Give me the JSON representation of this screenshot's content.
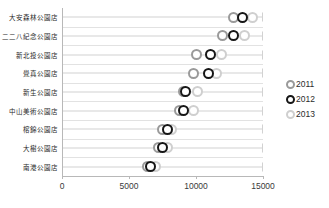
{
  "chart_data": {
    "type": "scatter",
    "title": "",
    "subtitle": "",
    "xlabel": "",
    "ylabel": "",
    "xlim": [
      0,
      15000
    ],
    "xticks": [
      "0",
      "5000",
      "10000",
      "15000"
    ],
    "xtick_values": [
      0,
      5000,
      10000,
      15000
    ],
    "grid": true,
    "legend_position": "right",
    "categories": [
      "大安森林公園店",
      "二二八紀念公園店",
      "新北投公園店",
      "覺真公園店",
      "新生公園店",
      "中山美術公園店",
      "榕錦公園店",
      "大樹公園店",
      "南港公園店"
    ],
    "series": [
      {
        "name": "2011",
        "color": "#9a9a9a",
        "values": [
          12800,
          12000,
          10000,
          9800,
          9100,
          8800,
          7500,
          7200,
          6400
        ]
      },
      {
        "name": "2012",
        "color": "#161616",
        "values": [
          13500,
          12800,
          11100,
          10900,
          9200,
          9100,
          7900,
          7500,
          6600
        ]
      },
      {
        "name": "2013",
        "color": "#cfcfcf",
        "values": [
          14200,
          13600,
          11900,
          11500,
          10100,
          9800,
          8200,
          7900,
          7000
        ]
      }
    ]
  },
  "legend": {
    "items": [
      {
        "label": "2011",
        "marker": "ring-icon-gray"
      },
      {
        "label": "2012",
        "marker": "ring-icon-black"
      },
      {
        "label": "2013",
        "marker": "ring-icon-light"
      }
    ]
  }
}
